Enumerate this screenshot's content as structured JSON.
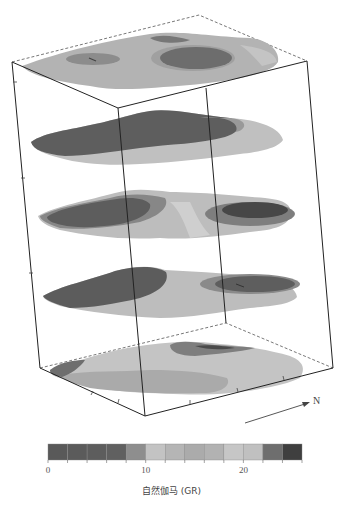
{
  "figure": {
    "north_label": "N",
    "colorbar": {
      "title": "自然伽马 (GR)",
      "tick_labels": [
        {
          "value": 0,
          "text": "0"
        },
        {
          "value": 10,
          "text": "10"
        },
        {
          "value": 20,
          "text": "20"
        }
      ],
      "min": 0,
      "max": 26,
      "step": 2,
      "colors": [
        "#595959",
        "#5b5b5b",
        "#5d5d5d",
        "#606060",
        "#8e8e8e",
        "#c3c3c3",
        "#b5b5b5",
        "#ababab",
        "#b2b2b2",
        "#c6c6c6",
        "#c0c0c0",
        "#6e6e6e",
        "#3f3f3f"
      ]
    },
    "slices": [
      {
        "name": "slice-top-surface",
        "layer": 1
      },
      {
        "name": "slice-2",
        "layer": 2
      },
      {
        "name": "slice-3",
        "layer": 3
      },
      {
        "name": "slice-4",
        "layer": 4
      },
      {
        "name": "slice-bottom-surface",
        "layer": 5
      }
    ]
  },
  "chart_data": {
    "type": "heatmap",
    "title": "",
    "colorbar_label": "自然伽马 (GR)",
    "colorbar_range": [
      0,
      26
    ],
    "colorbar_ticks": [
      0,
      10,
      20
    ],
    "colorbar_bins": 13,
    "num_slices": 5,
    "north_arrow": "N"
  }
}
